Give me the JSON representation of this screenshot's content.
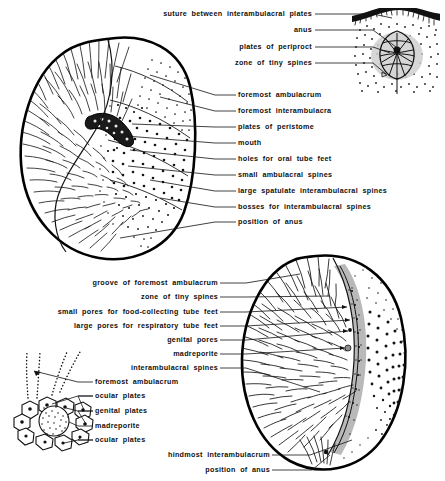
{
  "figure": {
    "background_color": "#ffffff",
    "ink_color": "#111111",
    "gray_accent": "#b9b9b9"
  },
  "labels": {
    "top_right_group": [
      {
        "id": "suture-between-interambulacral-plates",
        "text": "suture between interambulacral plates",
        "align": "right",
        "x": 312,
        "y": 14
      },
      {
        "id": "anus",
        "text": "anus",
        "align": "right",
        "x": 312,
        "y": 30
      },
      {
        "id": "plates-of-periproct",
        "text": "plates of periproct",
        "align": "right",
        "x": 312,
        "y": 47
      },
      {
        "id": "zone-of-tiny-spines-top",
        "text": "zone of tiny spines",
        "align": "right",
        "x": 312,
        "y": 63
      }
    ],
    "middle_group": [
      {
        "id": "foremost-ambulacrum-top",
        "text": "foremost ambulacrum",
        "align": "left",
        "x": 238,
        "y": 95
      },
      {
        "id": "foremost-interambulacra",
        "text": "foremost interambulacra",
        "align": "left",
        "x": 238,
        "y": 111
      },
      {
        "id": "plates-of-peristome",
        "text": "plates of peristome",
        "align": "left",
        "x": 238,
        "y": 127
      },
      {
        "id": "mouth",
        "text": "mouth",
        "align": "left",
        "x": 238,
        "y": 143
      },
      {
        "id": "holes-for-oral-tube-feet",
        "text": "holes for oral tube feet",
        "align": "left",
        "x": 238,
        "y": 159
      },
      {
        "id": "small-ambulacral-spines",
        "text": "small ambulacral spines",
        "align": "left",
        "x": 238,
        "y": 175
      },
      {
        "id": "large-spatulate-interambulacral-spines",
        "text": "large spatulate interambulacral spines",
        "align": "left",
        "x": 238,
        "y": 191
      },
      {
        "id": "bosses-for-interambulacral-spines",
        "text": "bosses for interambulacral spines",
        "align": "left",
        "x": 238,
        "y": 207
      },
      {
        "id": "position-of-anus-top",
        "text": "position of anus",
        "align": "left",
        "x": 238,
        "y": 222
      }
    ],
    "lower_left_group": [
      {
        "id": "groove-of-foremost-ambulacrum",
        "text": "groove of foremost ambulacrum",
        "align": "right",
        "x": 218,
        "y": 283
      },
      {
        "id": "zone-of-tiny-spines-lower",
        "text": "zone of tiny spines",
        "align": "right",
        "x": 218,
        "y": 297
      },
      {
        "id": "small-pores-for-food-collecting-tube-feet",
        "text": "small pores for food-collecting tube feet",
        "align": "right",
        "x": 218,
        "y": 312
      },
      {
        "id": "large-pores-for-respiratory-tube-feet",
        "text": "large pores for respiratory tube feet",
        "align": "right",
        "x": 218,
        "y": 326
      },
      {
        "id": "genital-pores",
        "text": "genital pores",
        "align": "right",
        "x": 218,
        "y": 340
      },
      {
        "id": "madreporite-right",
        "text": "madreporite",
        "align": "right",
        "x": 218,
        "y": 354
      },
      {
        "id": "interambulacral-spines",
        "text": "interambulacral spines",
        "align": "right",
        "x": 218,
        "y": 368
      }
    ],
    "apical_disc_group": [
      {
        "id": "foremost-ambulacrum-disc",
        "text": "foremost ambulacrum",
        "align": "left",
        "x": 95,
        "y": 382
      },
      {
        "id": "ocular-plates-upper",
        "text": "ocular plates",
        "align": "left",
        "x": 95,
        "y": 396
      },
      {
        "id": "genital-plates",
        "text": "genital plates",
        "align": "left",
        "x": 95,
        "y": 411
      },
      {
        "id": "madreporite-disc",
        "text": "madreporite",
        "align": "left",
        "x": 95,
        "y": 426
      },
      {
        "id": "ocular-plates-lower",
        "text": "ocular plates",
        "align": "left",
        "x": 95,
        "y": 440
      }
    ],
    "bottom_group": [
      {
        "id": "hindmost-interambulacrum",
        "text": "hindmost interambulacrum",
        "align": "right",
        "x": 270,
        "y": 455
      },
      {
        "id": "position-of-anus-bottom",
        "text": "position of anus",
        "align": "right",
        "x": 270,
        "y": 470
      }
    ]
  }
}
